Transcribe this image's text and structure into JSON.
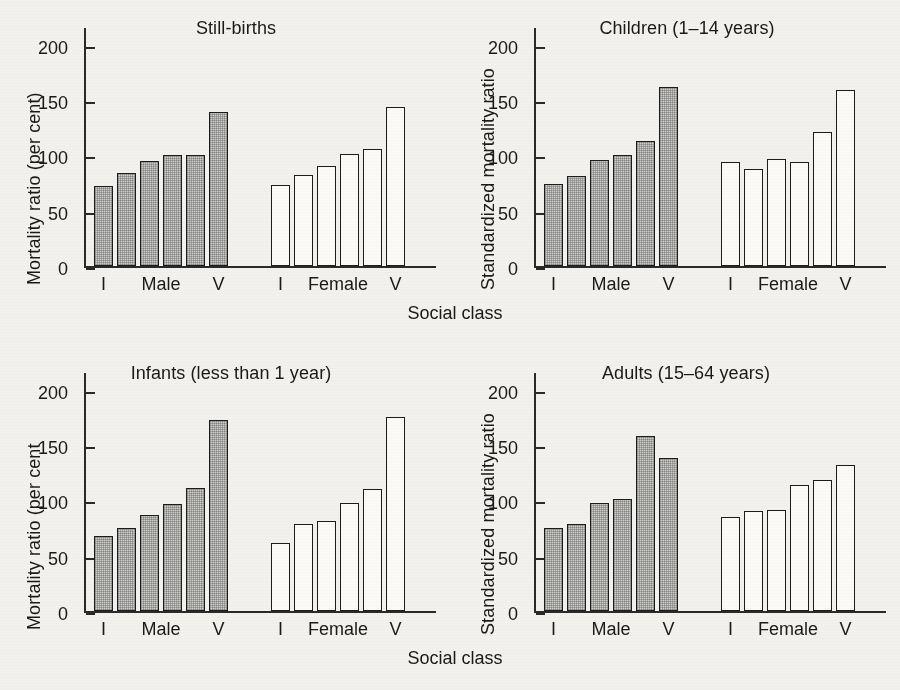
{
  "figure": {
    "xaxis_title": "Social class",
    "background_color": "#f2f1ee",
    "bar_male_fill": "#cfcfcb",
    "bar_female_fill": "#fbfaf7",
    "bar_outline": "#1c1c1c"
  },
  "panels": [
    {
      "id": "still-births",
      "title": "Still-births",
      "ylabel": "Mortality ratio (per cent)",
      "ticks": [
        "0",
        "50",
        "100",
        "150",
        "200"
      ],
      "cat_left": "I",
      "cat_group_male": "Male",
      "cat_right": "V",
      "cat_group_female": "Female"
    },
    {
      "id": "children",
      "title": "Children (1–14 years)",
      "ylabel": "Standardized mortality ratio",
      "ticks": [
        "0",
        "50",
        "100",
        "150",
        "200"
      ],
      "cat_left": "I",
      "cat_group_male": "Male",
      "cat_right": "V",
      "cat_group_female": "Female"
    },
    {
      "id": "infants",
      "title": "Infants (less than 1 year)",
      "ylabel": "Mortality ratio (per cent",
      "ticks": [
        "0",
        "50",
        "100",
        "150",
        "200"
      ],
      "cat_left": "I",
      "cat_group_male": "Male",
      "cat_right": "V",
      "cat_group_female": "Female"
    },
    {
      "id": "adults",
      "title": "Adults (15–64 years)",
      "ylabel": "Standardized mortality ratio",
      "ticks": [
        "0",
        "50",
        "100",
        "150",
        "200"
      ],
      "cat_left": "I",
      "cat_group_male": "Male",
      "cat_right": "V",
      "cat_group_female": "Female"
    }
  ],
  "chart_data": [
    {
      "type": "bar",
      "title": "Still-births",
      "xlabel": "Social class",
      "ylabel": "Mortality ratio (per cent)",
      "ylim": [
        0,
        215
      ],
      "yticks": [
        0,
        50,
        100,
        150,
        200
      ],
      "grid": false,
      "legend": "none",
      "categories": [
        "I",
        "II",
        "IIIN",
        "IIIM",
        "IV",
        "V"
      ],
      "series": [
        {
          "name": "Male",
          "values": [
            72,
            84,
            95,
            100,
            100,
            139
          ]
        },
        {
          "name": "Female",
          "values": [
            73,
            82,
            90,
            101,
            106,
            144
          ]
        }
      ]
    },
    {
      "type": "bar",
      "title": "Children (1–14 years)",
      "xlabel": "Social class",
      "ylabel": "Standardized mortality ratio",
      "ylim": [
        0,
        215
      ],
      "yticks": [
        0,
        50,
        100,
        150,
        200
      ],
      "grid": false,
      "legend": "none",
      "categories": [
        "I",
        "II",
        "IIIN",
        "IIIM",
        "IV",
        "V"
      ],
      "series": [
        {
          "name": "Male",
          "values": [
            74,
            81,
            96,
            100,
            113,
            162
          ]
        },
        {
          "name": "Female",
          "values": [
            94,
            88,
            97,
            94,
            121,
            159
          ]
        }
      ]
    },
    {
      "type": "bar",
      "title": "Infants (less than 1 year)",
      "xlabel": "Social class",
      "ylabel": "Mortality ratio (per cent",
      "ylim": [
        0,
        215
      ],
      "yticks": [
        0,
        50,
        100,
        150,
        200
      ],
      "grid": false,
      "legend": "none",
      "categories": [
        "I",
        "II",
        "IIIN",
        "IIIM",
        "IV",
        "V"
      ],
      "series": [
        {
          "name": "Male",
          "values": [
            68,
            75,
            87,
            97,
            111,
            173
          ]
        },
        {
          "name": "Female",
          "values": [
            61,
            79,
            81,
            98,
            110,
            175
          ]
        }
      ]
    },
    {
      "type": "bar",
      "title": "Adults (15–64 years)",
      "xlabel": "Social class",
      "ylabel": "Standardized mortality ratio",
      "ylim": [
        0,
        215
      ],
      "yticks": [
        0,
        50,
        100,
        150,
        200
      ],
      "grid": false,
      "legend": "none",
      "categories": [
        "I",
        "II",
        "IIIN",
        "IIIM",
        "IV",
        "V"
      ],
      "series": [
        {
          "name": "Male",
          "values": [
            75,
            79,
            98,
            101,
            158,
            138
          ]
        },
        {
          "name": "Female",
          "values": [
            85,
            90,
            91,
            114,
            118,
            132
          ]
        }
      ]
    }
  ]
}
